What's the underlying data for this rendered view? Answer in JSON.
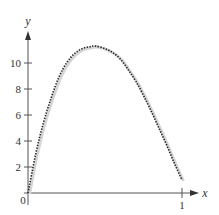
{
  "chart_data": {
    "type": "line",
    "title": "",
    "xlabel": "x",
    "ylabel": "y",
    "xlim": [
      0,
      1.1
    ],
    "ylim": [
      0,
      12.5
    ],
    "grid": false,
    "legend": null,
    "x_ticks": [
      {
        "value": 1,
        "label": "1"
      }
    ],
    "y_ticks": [
      {
        "value": 2,
        "label": "2"
      },
      {
        "value": 4,
        "label": "4"
      },
      {
        "value": 6,
        "label": "6"
      },
      {
        "value": 8,
        "label": "8"
      },
      {
        "value": 10,
        "label": "10"
      }
    ],
    "origin_label": "0",
    "series": [
      {
        "name": "curve",
        "style": "dotted black over light gray solid",
        "x": [
          0,
          0.05,
          0.1,
          0.15,
          0.2,
          0.25,
          0.3,
          0.35,
          0.4,
          0.44,
          0.5,
          0.55,
          0.6,
          0.65,
          0.7,
          0.75,
          0.8,
          0.85,
          0.9,
          0.95,
          1.0
        ],
        "y": [
          0,
          3.0,
          5.4,
          7.3,
          8.9,
          10.0,
          10.7,
          11.1,
          11.25,
          11.3,
          11.1,
          10.8,
          10.3,
          9.5,
          8.6,
          7.5,
          6.3,
          5.0,
          3.7,
          2.3,
          1.0
        ]
      }
    ]
  },
  "axes": {
    "x_label": "x",
    "y_label": "y",
    "origin": "0",
    "x_tick_1": "1",
    "y_tick_2": "2",
    "y_tick_4": "4",
    "y_tick_6": "6",
    "y_tick_8": "8",
    "y_tick_10": "10"
  },
  "colors": {
    "axis": "#555555",
    "curve": "#222222",
    "shadow": "#d0d0d0"
  }
}
